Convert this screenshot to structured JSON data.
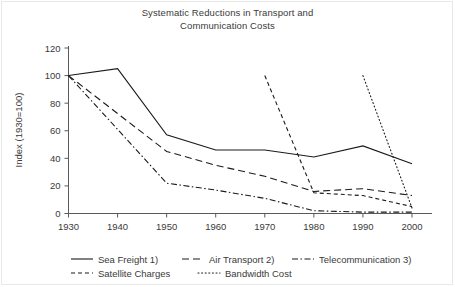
{
  "chart_data": {
    "type": "line",
    "title": "Systematic Reductions in Transport and Communication Costs",
    "title_line1": "Systematic Reductions in Transport and",
    "title_line2": "Communication Costs",
    "xlabel": "",
    "ylabel": "Index (1930=100)",
    "x": [
      1930,
      1940,
      1950,
      1960,
      1970,
      1980,
      1990,
      2000
    ],
    "xticklabels": [
      "1930",
      "1940",
      "1950",
      "1960",
      "1970",
      "1980",
      "1990",
      "2000"
    ],
    "yticklabels": [
      "0",
      "20",
      "40",
      "60",
      "80",
      "100",
      "120"
    ],
    "yticks": [
      0,
      20,
      40,
      60,
      80,
      100,
      120
    ],
    "xlim": [
      1930,
      2000
    ],
    "ylim": [
      0,
      120
    ],
    "grid": false,
    "legend_position": "below-axis",
    "series": [
      {
        "name": "Sea Freight 1)",
        "style": "solid",
        "x": [
          1930,
          1940,
          1950,
          1960,
          1970,
          1980,
          1990,
          2000
        ],
        "values": [
          100,
          105,
          57,
          46,
          46,
          41,
          49,
          36
        ]
      },
      {
        "name": "Air Transport 2)",
        "style": "long-dash",
        "x": [
          1930,
          1950,
          1960,
          1970,
          1980,
          1990,
          2000
        ],
        "values": [
          100,
          45,
          35,
          27,
          16,
          18,
          13
        ]
      },
      {
        "name": "Telecommunication 3)",
        "style": "dash-dot",
        "x": [
          1930,
          1950,
          1960,
          1970,
          1980,
          1990,
          2000
        ],
        "values": [
          100,
          22,
          17,
          11,
          2,
          1,
          1
        ]
      },
      {
        "name": "Satellite Charges",
        "style": "short-dash",
        "x": [
          1970,
          1980,
          1990,
          2000
        ],
        "values": [
          100,
          15,
          13,
          5
        ]
      },
      {
        "name": "Bandwidth Cost",
        "style": "dotted",
        "x": [
          1990,
          2000
        ],
        "values": [
          100,
          4
        ]
      }
    ]
  },
  "legend": {
    "row1": [
      {
        "label": "Sea Freight 1)",
        "style": "solid"
      },
      {
        "label": "Air Transport 2)",
        "style": "long-dash"
      },
      {
        "label": "Telecommunication 3)",
        "style": "dash-dot"
      }
    ],
    "row2": [
      {
        "label": "Satellite Charges",
        "style": "short-dash"
      },
      {
        "label": "Bandwidth Cost",
        "style": "dotted"
      }
    ]
  },
  "colors": {
    "line": "#1a1a1a",
    "axis": "#5a5a5a",
    "text": "#3a3a3a",
    "background": "#ffffff",
    "border": "#e8e8e8"
  }
}
